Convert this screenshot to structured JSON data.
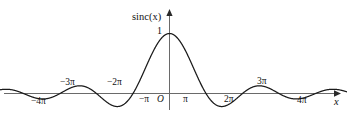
{
  "chart_data": {
    "type": "line",
    "title": "",
    "subtitle": "",
    "xlabel": "x",
    "ylabel": "sinc(x)",
    "function": "sinc(x) = sin(x)/x",
    "grid": false,
    "legend": null,
    "xlim": [
      -4.7,
      4.9
    ],
    "ylim": [
      -0.35,
      1.15
    ],
    "xlim_units": "pi",
    "x_tick_labels": [
      "−4π",
      "−3π",
      "−2π",
      "−π",
      "π",
      "2π",
      "3π",
      "4π"
    ],
    "x_tick_values_pi": [
      -4,
      -3,
      -2,
      -1,
      1,
      2,
      3,
      4
    ],
    "y_tick_labels": [
      "1"
    ],
    "y_tick_values": [
      1
    ],
    "origin_label": "O",
    "x_in_pi": [
      -4.7,
      -4.5,
      -4.25,
      -4,
      -3.75,
      -3.5,
      -3.25,
      -3,
      -2.75,
      -2.5,
      -2.25,
      -2,
      -1.75,
      -1.5,
      -1.25,
      -1,
      -0.875,
      -0.75,
      -0.625,
      -0.5,
      -0.375,
      -0.25,
      -0.125,
      0,
      0.125,
      0.25,
      0.375,
      0.5,
      0.625,
      0.75,
      0.875,
      1,
      1.25,
      1.5,
      1.75,
      2,
      2.25,
      2.5,
      2.75,
      3,
      3.25,
      3.5,
      3.75,
      4,
      4.25,
      4.5,
      4.7
    ],
    "y_values": [
      -0.0197,
      0.0,
      0.053,
      0.0,
      -0.0674,
      0.0,
      0.0909,
      0.0,
      -0.1156,
      0.0,
      0.1416,
      0.0,
      -0.1819,
      0.2122,
      -0.2546,
      0.0,
      0.1261,
      0.3001,
      0.4952,
      0.6366,
      0.7767,
      0.9003,
      0.9745,
      1.0,
      0.9745,
      0.9003,
      0.7767,
      0.6366,
      0.4952,
      0.3001,
      0.1261,
      0.0,
      -0.2546,
      0.2122,
      -0.1819,
      0.0,
      0.1416,
      0.0,
      -0.1156,
      0.0,
      0.0909,
      0.0,
      -0.0674,
      0.0,
      0.053,
      0.0,
      -0.0197
    ],
    "peak_value": 1,
    "peak_x": 0,
    "zeros_at_pi_multiples": true,
    "curve_color": "#1a1a1a",
    "axis_color": "#555555",
    "background_color": "#ffffff"
  },
  "labels": {
    "y_axis_name": "sinc(x)",
    "x_axis_name": "x",
    "peak": "1",
    "origin": "O",
    "neg_4pi": "−4π",
    "neg_3pi": "−3π",
    "neg_2pi": "−2π",
    "neg_pi": "−π",
    "pos_pi": "π",
    "pos_2pi": "2π",
    "pos_3pi": "3π",
    "pos_4pi": "4π"
  }
}
